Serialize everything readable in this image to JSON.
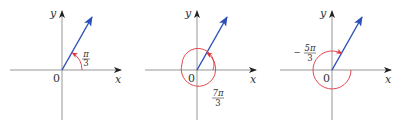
{
  "colors": {
    "axis": "#8a8a8a",
    "terminal_side": "#2a4fb8",
    "angle_arc": "#e0333a",
    "text": "#333333"
  },
  "diagrams": [
    {
      "id": "angle-pi-over-3",
      "x_label": "x",
      "y_label": "y",
      "origin_label": "0",
      "angle": {
        "sign": "",
        "numerator": "π",
        "denominator": "3",
        "direction": "counterclockwise"
      }
    },
    {
      "id": "angle-7pi-over-3",
      "x_label": "x",
      "y_label": "y",
      "origin_label": "0",
      "angle": {
        "sign": "",
        "numerator": "7π",
        "denominator": "3",
        "direction": "counterclockwise"
      }
    },
    {
      "id": "angle-neg-5pi-over-3",
      "x_label": "x",
      "y_label": "y",
      "origin_label": "0",
      "angle": {
        "sign": "−",
        "numerator": "5π",
        "denominator": "3",
        "direction": "clockwise"
      }
    }
  ]
}
